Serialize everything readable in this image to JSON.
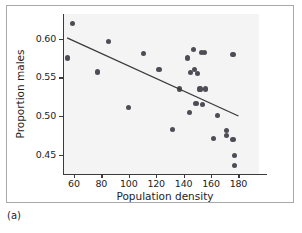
{
  "figure": {
    "panel_label": "(a)",
    "frame_color": "#a9a9a9",
    "panel_background": "#f4f4f4",
    "marker_color": "#4d4d55",
    "line_color": "#3b3b3b"
  },
  "chart_data": {
    "type": "scatter",
    "title": "",
    "xlabel": "Population density",
    "ylabel": "Proportion males",
    "xlim": [
      52,
      195
    ],
    "ylim": [
      0.425,
      0.632
    ],
    "xticks": [
      60,
      80,
      100,
      120,
      140,
      160,
      180
    ],
    "yticks": [
      0.45,
      0.5,
      0.55,
      0.6
    ],
    "xtick_labels": [
      "60",
      "80",
      "100",
      "120",
      "140",
      "160",
      "180"
    ],
    "ytick_labels": [
      "0.45",
      "0.50",
      "0.55",
      "0.60"
    ],
    "grid": false,
    "legend": "none",
    "x": [
      59,
      55,
      77,
      85,
      100,
      111,
      122,
      132,
      137,
      143,
      144,
      145,
      147,
      148,
      149,
      150,
      152,
      153,
      154,
      155,
      156,
      162,
      165,
      171,
      171,
      176,
      176,
      177,
      177
    ],
    "y": [
      0.62,
      0.575,
      0.557,
      0.596,
      0.511,
      0.581,
      0.56,
      0.483,
      0.535,
      0.575,
      0.505,
      0.556,
      0.586,
      0.56,
      0.516,
      0.555,
      0.535,
      0.582,
      0.515,
      0.582,
      0.535,
      0.471,
      0.501,
      0.481,
      0.475,
      0.58,
      0.47,
      0.449,
      0.436
    ],
    "series": [
      {
        "name": "observations",
        "points": [
          [
            59,
            0.62
          ],
          [
            55,
            0.575
          ],
          [
            77,
            0.557
          ],
          [
            85,
            0.596
          ],
          [
            100,
            0.511
          ],
          [
            111,
            0.581
          ],
          [
            122,
            0.56
          ],
          [
            132,
            0.483
          ],
          [
            137,
            0.535
          ],
          [
            143,
            0.575
          ],
          [
            144,
            0.505
          ],
          [
            145,
            0.556
          ],
          [
            147,
            0.586
          ],
          [
            148,
            0.56
          ],
          [
            149,
            0.516
          ],
          [
            150,
            0.555
          ],
          [
            152,
            0.535
          ],
          [
            153,
            0.582
          ],
          [
            154,
            0.515
          ],
          [
            155,
            0.582
          ],
          [
            156,
            0.535
          ],
          [
            162,
            0.471
          ],
          [
            165,
            0.501
          ],
          [
            171,
            0.481
          ],
          [
            171,
            0.475
          ],
          [
            176,
            0.58
          ],
          [
            176,
            0.47
          ],
          [
            177,
            0.449
          ],
          [
            177,
            0.436
          ]
        ]
      }
    ],
    "trend_line": {
      "type": "linear-fit",
      "x_start": 55,
      "y_start": 0.601,
      "x_end": 180,
      "y_end": 0.5
    }
  }
}
